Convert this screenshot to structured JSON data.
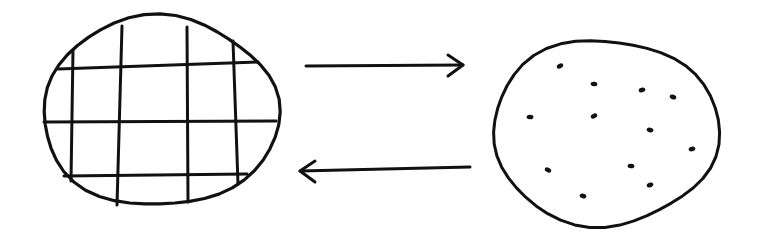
{
  "diagram": {
    "ink_color": "#111111",
    "background": "#ffffff",
    "left_shape": {
      "kind": "circle-with-grid",
      "outline": {
        "cx": 160,
        "cy": 112,
        "rx": 118,
        "ry": 95
      },
      "grid": {
        "vertical": [
          {
            "x1": 73,
            "y1": 50,
            "x2": 71,
            "y2": 181
          },
          {
            "x1": 122,
            "y1": 26,
            "x2": 117,
            "y2": 205
          },
          {
            "x1": 187,
            "y1": 27,
            "x2": 188,
            "y2": 202
          },
          {
            "x1": 233,
            "y1": 41,
            "x2": 238,
            "y2": 184
          }
        ],
        "horizontal": [
          {
            "x1": 58,
            "y1": 69,
            "x2": 258,
            "y2": 62
          },
          {
            "x1": 44,
            "y1": 122,
            "x2": 276,
            "y2": 121
          },
          {
            "x1": 64,
            "y1": 176,
            "x2": 247,
            "y2": 174
          }
        ]
      }
    },
    "arrows": [
      {
        "name": "arrow-right",
        "direction": "right",
        "x1": 306,
        "y1": 66,
        "x2": 463,
        "y2": 65
      },
      {
        "name": "arrow-left",
        "direction": "left",
        "x1": 470,
        "y1": 167,
        "x2": 300,
        "y2": 171
      }
    ],
    "right_shape": {
      "kind": "circle-with-dots",
      "outline": {
        "cx": 605,
        "cy": 132,
        "rx": 113,
        "ry": 93
      },
      "dots": [
        {
          "x": 560,
          "y": 66
        },
        {
          "x": 594,
          "y": 84
        },
        {
          "x": 642,
          "y": 90
        },
        {
          "x": 673,
          "y": 97
        },
        {
          "x": 530,
          "y": 117
        },
        {
          "x": 594,
          "y": 116
        },
        {
          "x": 650,
          "y": 130
        },
        {
          "x": 692,
          "y": 149
        },
        {
          "x": 548,
          "y": 170
        },
        {
          "x": 631,
          "y": 166
        },
        {
          "x": 650,
          "y": 185
        },
        {
          "x": 583,
          "y": 196
        }
      ]
    }
  }
}
